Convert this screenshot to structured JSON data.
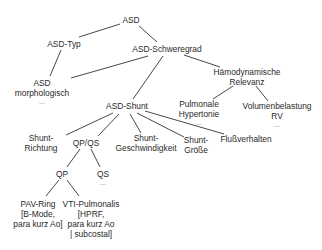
{
  "diagram": {
    "type": "tree",
    "nodes": {
      "asd": {
        "lines": [
          "ASD"
        ]
      },
      "asd_typ": {
        "lines": [
          "ASD-Typ"
        ]
      },
      "asd_schweregrad": {
        "lines": [
          "ASD-Schweregrad"
        ]
      },
      "asd_morphologisch": {
        "lines": [
          "ASD",
          "morphologisch"
        ],
        "more": "..."
      },
      "haemodynamische_relevanz": {
        "lines": [
          "Hämodynamische",
          "Relevanz"
        ]
      },
      "asd_shunt": {
        "lines": [
          "ASD-Shunt"
        ]
      },
      "pulmonale_hypertonie": {
        "lines": [
          "Pulmonale",
          "Hypertonie"
        ],
        "more": "..."
      },
      "volumenbelastung_rv": {
        "lines": [
          "Volumenbelastung",
          "RV"
        ],
        "more": "..."
      },
      "shunt_richtung": {
        "lines": [
          "Shunt-",
          "Richtung"
        ]
      },
      "qp_qs": {
        "lines": [
          "QP/QS"
        ]
      },
      "shunt_geschwindigkeit": {
        "lines": [
          "Shunt-",
          "Geschwindigkeit"
        ]
      },
      "shunt_groesse": {
        "lines": [
          "Shunt-",
          "Größe"
        ]
      },
      "flussverhalten": {
        "lines": [
          "Flußverhalten"
        ]
      },
      "qp": {
        "lines": [
          "QP"
        ]
      },
      "qs": {
        "lines": [
          "QS"
        ],
        "more": "..."
      },
      "pav_ring": {
        "lines": [
          "PAV-Ring",
          "[B-Mode,",
          "para kurz Ao]"
        ]
      },
      "vti_pulmonalis": {
        "lines": [
          "VTI-Pulmonalis",
          "[HPRF,",
          "para kurz Ao",
          "| subcostal]"
        ]
      }
    },
    "edges": [
      [
        "asd",
        "asd_typ"
      ],
      [
        "asd",
        "asd_schweregrad"
      ],
      [
        "asd_typ",
        "asd_morphologisch"
      ],
      [
        "asd_schweregrad",
        "asd_morphologisch"
      ],
      [
        "asd_schweregrad",
        "asd_shunt"
      ],
      [
        "asd_schweregrad",
        "haemodynamische_relevanz"
      ],
      [
        "haemodynamische_relevanz",
        "pulmonale_hypertonie"
      ],
      [
        "haemodynamische_relevanz",
        "volumenbelastung_rv"
      ],
      [
        "asd_shunt",
        "shunt_richtung"
      ],
      [
        "asd_shunt",
        "qp_qs"
      ],
      [
        "asd_shunt",
        "shunt_geschwindigkeit"
      ],
      [
        "asd_shunt",
        "shunt_groesse"
      ],
      [
        "asd_shunt",
        "flussverhalten"
      ],
      [
        "qp_qs",
        "qp"
      ],
      [
        "qp_qs",
        "qs"
      ],
      [
        "qp",
        "pav_ring"
      ],
      [
        "qp",
        "vti_pulmonalis"
      ]
    ]
  }
}
